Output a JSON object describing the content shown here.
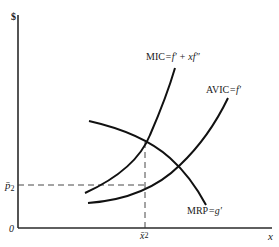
{
  "diagram": {
    "axes": {
      "y_label": "$",
      "x_label": "x",
      "origin_label": "0"
    },
    "guides": {
      "price_label": "p̄",
      "price_subscript": "2",
      "quantity_label": "x̄",
      "quantity_superscript": "2"
    },
    "curves": [
      {
        "id": "mic",
        "label_main": "MIC",
        "label_eq": "=f′ + xf″",
        "description": "marginal input cost, upward sloping, steeper"
      },
      {
        "id": "avic",
        "label_main": "AVIC",
        "label_eq": "=f′",
        "description": "average variable input cost, upward sloping"
      },
      {
        "id": "mrp",
        "label_main": "MRP",
        "label_eq": "=g′",
        "description": "marginal revenue product, downward sloping"
      }
    ],
    "colors": {
      "line": "#111111",
      "background": "#ffffff"
    }
  }
}
